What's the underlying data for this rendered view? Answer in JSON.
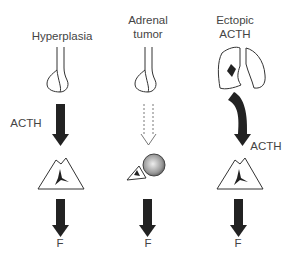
{
  "columns": [
    {
      "title": "Hyperplasia",
      "signal_label": "ACTH",
      "output_label": "F",
      "source": "pituitary",
      "signal_style": "solid"
    },
    {
      "title_line1": "Adrenal",
      "title_line2": "tumor",
      "output_label": "F",
      "source": "pituitary",
      "signal_style": "dashed-suppressed"
    },
    {
      "title_line1": "Ectopic",
      "title_line2": "ACTH",
      "signal_label": "ACTH",
      "output_label": "F",
      "source": "lung-tumor",
      "signal_style": "solid-curved"
    }
  ]
}
